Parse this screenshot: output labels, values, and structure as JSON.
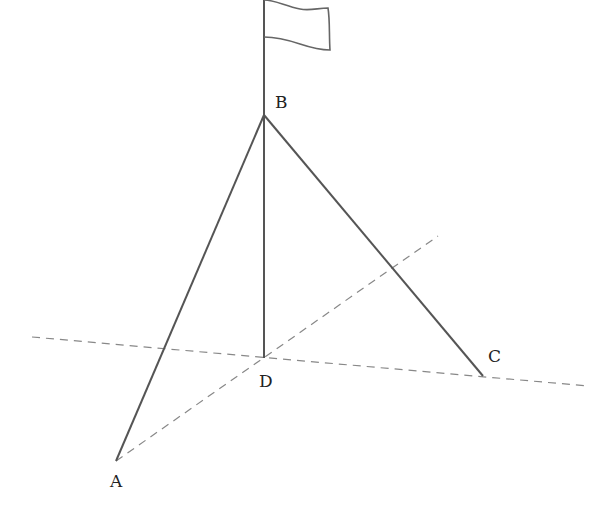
{
  "diagram": {
    "type": "geometry",
    "colors": {
      "solid": "#555555",
      "dashed": "#888888",
      "text": "#222222",
      "flag": "#666666"
    },
    "points": {
      "A": {
        "label": "A",
        "x": 116,
        "y": 461,
        "lx": 110,
        "ly": 487
      },
      "B": {
        "label": "B",
        "x": 264,
        "y": 115,
        "lx": 275,
        "ly": 108
      },
      "C": {
        "label": "C",
        "x": 483,
        "y": 376,
        "lx": 488,
        "ly": 362
      },
      "D": {
        "label": "D",
        "x": 264,
        "y": 358,
        "lx": 259,
        "ly": 387
      }
    },
    "segments": [
      {
        "name": "segment-BA",
        "from": "B",
        "to": "A",
        "style": "solid"
      },
      {
        "name": "segment-BC",
        "from": "B",
        "to": "C",
        "style": "solid"
      },
      {
        "name": "segment-BD",
        "from": "B",
        "to": "D",
        "style": "solid"
      }
    ],
    "dashed_lines": [
      {
        "name": "ground-line-DC",
        "x1": 32,
        "y1": 337,
        "x2": 588,
        "y2": 386
      },
      {
        "name": "ground-line-AD",
        "x1": 116,
        "y1": 461,
        "x2": 438,
        "y2": 236
      }
    ],
    "pole_top": {
      "x": 264,
      "y": 0
    },
    "flag": {
      "attach_top_y": 0,
      "attach_bottom_y": 37
    }
  }
}
